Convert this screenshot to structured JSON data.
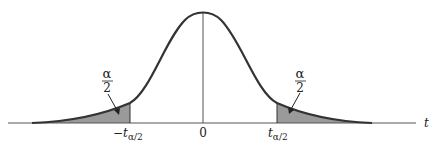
{
  "figure": {
    "type": "t-distribution two-tailed critical region diagram",
    "axis_label": "t",
    "center_label": "0",
    "left_cutoff_label": "−t",
    "left_cutoff_sub": "α/2",
    "right_cutoff_label": "t",
    "right_cutoff_sub": "α/2",
    "left_area_num": "α",
    "left_area_den": "2",
    "right_area_num": "α",
    "right_area_den": "2",
    "colors": {
      "curve": "#333333",
      "shade": "#9a9a9a",
      "axis": "#555555"
    }
  }
}
